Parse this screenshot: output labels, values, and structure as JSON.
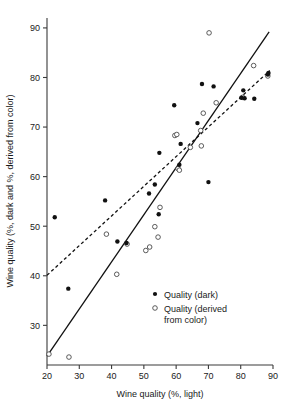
{
  "chart_data": {
    "type": "scatter",
    "title": "",
    "xlabel": "Wine quality (%, light)",
    "ylabel": "Wine quality (%, dark and %, derived from color)",
    "xlim": [
      20,
      90
    ],
    "ylim": [
      22,
      92
    ],
    "xticks": [
      20,
      30,
      40,
      50,
      60,
      70,
      80,
      90
    ],
    "yticks": [
      30,
      40,
      50,
      60,
      70,
      80,
      90
    ],
    "xtick_labels": [
      "20",
      "30",
      "40",
      "50",
      "60",
      "70",
      "80",
      "90"
    ],
    "ytick_labels": [
      "30",
      "40",
      "50",
      "60",
      "70",
      "80",
      "90"
    ],
    "grid": false,
    "legend_position": "lower-right",
    "series": [
      {
        "name": "Quality (dark)",
        "marker": "filled-circle",
        "color": "#111111",
        "points": [
          [
            22.4,
            51.8
          ],
          [
            26.6,
            37.4
          ],
          [
            38.0,
            55.2
          ],
          [
            41.8,
            46.9
          ],
          [
            44.6,
            46.6
          ],
          [
            51.6,
            56.6
          ],
          [
            53.4,
            58.4
          ],
          [
            54.6,
            52.4
          ],
          [
            54.8,
            64.8
          ],
          [
            59.4,
            74.4
          ],
          [
            61.0,
            62.4
          ],
          [
            61.4,
            66.6
          ],
          [
            66.6,
            70.8
          ],
          [
            68.0,
            78.7
          ],
          [
            70.0,
            58.9
          ],
          [
            71.6,
            78.2
          ],
          [
            80.2,
            75.9
          ],
          [
            80.8,
            77.4
          ],
          [
            81.2,
            75.8
          ],
          [
            84.2,
            75.7
          ],
          [
            88.4,
            80.6
          ],
          [
            88.6,
            80.9
          ]
        ]
      },
      {
        "name": "Quality (derived from color)",
        "marker": "open-circle",
        "color": "#4a4a4a",
        "points": [
          [
            20.6,
            24.2
          ],
          [
            26.8,
            23.6
          ],
          [
            38.4,
            48.4
          ],
          [
            41.6,
            40.3
          ],
          [
            44.8,
            46.4
          ],
          [
            50.6,
            45.1
          ],
          [
            51.8,
            45.8
          ],
          [
            53.4,
            49.9
          ],
          [
            54.4,
            47.8
          ],
          [
            55.0,
            53.8
          ],
          [
            59.6,
            68.3
          ],
          [
            60.2,
            68.5
          ],
          [
            60.6,
            61.6
          ],
          [
            61.0,
            61.3
          ],
          [
            64.4,
            65.9
          ],
          [
            67.6,
            69.3
          ],
          [
            67.8,
            66.2
          ],
          [
            68.4,
            72.8
          ],
          [
            70.2,
            89.0
          ],
          [
            72.4,
            74.9
          ],
          [
            80.6,
            76.0
          ],
          [
            84.0,
            82.4
          ],
          [
            88.4,
            80.3
          ]
        ]
      }
    ],
    "fit_lines": [
      {
        "name": "solid-fit",
        "style": "solid",
        "x": [
          20.0,
          88.8
        ],
        "y": [
          23.8,
          89.2
        ]
      },
      {
        "name": "dashed-fit",
        "style": "dashed",
        "x": [
          20.0,
          89.0
        ],
        "y": [
          40.1,
          81.4
        ]
      }
    ]
  },
  "legend": {
    "entries": [
      {
        "label": "Quality (dark)",
        "marker": "filled-circle"
      },
      {
        "label_line1": "Quality (derived",
        "label_line2": "from color)",
        "marker": "open-circle"
      }
    ]
  }
}
